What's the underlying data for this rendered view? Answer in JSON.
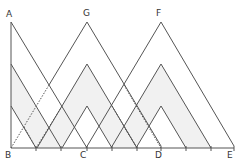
{
  "diagram": {
    "labels": {
      "A": "A",
      "G": "G",
      "F": "F",
      "B": "B",
      "C": "C",
      "D": "D",
      "E": "E"
    },
    "colors": {
      "line": "#555555",
      "shade": "#f1f1f1",
      "background": "#ffffff"
    },
    "baseline_ticks_x": [
      11,
      36,
      61,
      87,
      112,
      137,
      161,
      186,
      211,
      234
    ]
  }
}
